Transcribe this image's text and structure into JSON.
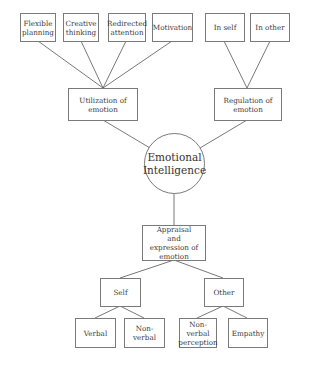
{
  "diagram": {
    "center": {
      "id": "ei",
      "label": "Emotional Intelligence"
    },
    "nodes": {
      "flexible": "Flexible planning",
      "creative": "Creative thinking",
      "redirected": "Redirected attention",
      "motivation": "Motivation",
      "inself": "In self",
      "inother": "In other",
      "utilization": "Utilization of emotion",
      "regulation": "Regulation of emotion",
      "appraisal": "Appraisal and expression of emotion",
      "self": "Self",
      "other": "Other",
      "verbal": "Verbal",
      "nonverbal": "Non-verbal",
      "nvperception": "Non-verbal perception",
      "empathy": "Empathy"
    },
    "edges": [
      [
        "flexible",
        "utilization"
      ],
      [
        "creative",
        "utilization"
      ],
      [
        "redirected",
        "utilization"
      ],
      [
        "motivation",
        "utilization"
      ],
      [
        "inself",
        "regulation"
      ],
      [
        "inother",
        "regulation"
      ],
      [
        "utilization",
        "ei"
      ],
      [
        "regulation",
        "ei"
      ],
      [
        "ei",
        "appraisal"
      ],
      [
        "appraisal",
        "self"
      ],
      [
        "appraisal",
        "other"
      ],
      [
        "self",
        "verbal"
      ],
      [
        "self",
        "nonverbal"
      ],
      [
        "other",
        "nvperception"
      ],
      [
        "other",
        "empathy"
      ]
    ]
  }
}
